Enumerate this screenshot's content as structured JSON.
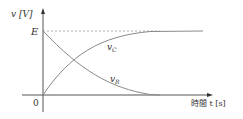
{
  "diagram": {
    "y_axis_label": "v [V]",
    "x_axis_label": "時間 t [s]",
    "origin_label": "0",
    "level_label": "E",
    "curves": [
      {
        "name": "vC",
        "label": "v_C",
        "label_main": "v",
        "label_sub": "C",
        "description": "rises from 0 to E"
      },
      {
        "name": "vR",
        "label": "v_R",
        "label_main": "v",
        "label_sub": "R",
        "description": "decays from E to 0"
      }
    ],
    "colors": {
      "axis": "#333333",
      "curve": "#8a8a8a",
      "dashed": "#999999"
    }
  }
}
